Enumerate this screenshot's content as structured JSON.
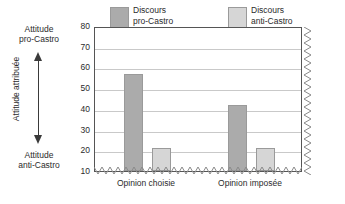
{
  "chart_data": {
    "type": "bar",
    "title": "",
    "subtitle": "",
    "xlabel": "",
    "ylabel": "Attitude attribuée",
    "ylim": [
      10,
      80
    ],
    "ytick_step": 10,
    "yticks": [
      "80",
      "70",
      "60",
      "50",
      "40",
      "30",
      "20",
      "10"
    ],
    "grid": true,
    "legend_position": "top",
    "categories": [
      "Opinion choisie",
      "Opinion imposée"
    ],
    "series": [
      {
        "name": "Discours pro-Castro",
        "name_line1": "Discours",
        "name_line2": "pro-Castro",
        "color": "#ababab",
        "values": [
          57,
          42
        ]
      },
      {
        "name": "Discours anti-Castro",
        "name_line1": "Discours",
        "name_line2": "anti-Castro",
        "color": "#d6d6d6",
        "values": [
          21,
          21
        ]
      }
    ],
    "annotations": {
      "axis_direction_top_line1": "Attitude",
      "axis_direction_top_line2": "pro-Castro",
      "axis_direction_bottom_line1": "Attitude",
      "axis_direction_bottom_line2": "anti-Castro",
      "arrow": "double-headed-vertical-arrow"
    },
    "decorations": {
      "bottom_edge": "zigzag-axis-break",
      "right_edge": "zigzag-axis-break"
    }
  }
}
